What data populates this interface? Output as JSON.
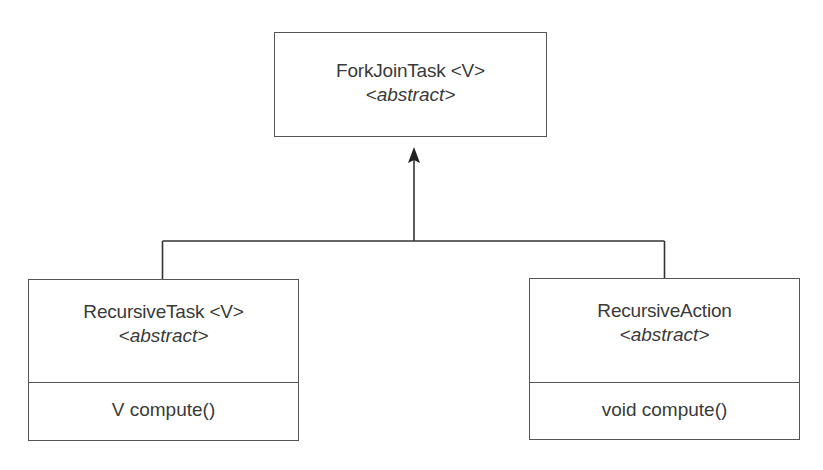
{
  "diagram": {
    "type": "uml-class-inheritance",
    "parent": {
      "name": "ForkJoinTask <V>",
      "stereotype": "<abstract>"
    },
    "children": [
      {
        "name": "RecursiveTask <V>",
        "stereotype": "<abstract>",
        "method": "V compute()"
      },
      {
        "name": "RecursiveAction",
        "stereotype": "<abstract>",
        "method": "void compute()"
      }
    ],
    "colors": {
      "line": "#333333",
      "border": "#555555",
      "text": "#3a3a3a",
      "background": "#ffffff"
    }
  }
}
